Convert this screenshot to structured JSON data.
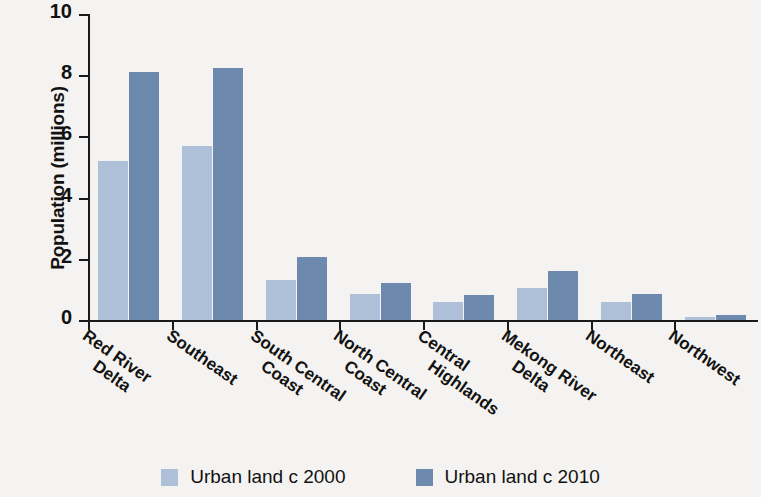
{
  "chart_data": {
    "type": "bar",
    "title": "",
    "xlabel": "",
    "ylabel": "Population (millions)",
    "ylim": [
      0,
      10
    ],
    "yticks": [
      0,
      2,
      4,
      6,
      8,
      10
    ],
    "grid": false,
    "legend_position": "bottom",
    "categories": [
      "Red River Delta",
      "Southeast",
      "South Central Coast",
      "North Central Coast",
      "Central Highlands",
      "Mekong River Delta",
      "Northeast",
      "Northwest"
    ],
    "category_lines": [
      [
        "Red River",
        "Delta"
      ],
      [
        "Southeast"
      ],
      [
        "South Central",
        "Coast"
      ],
      [
        "North Central",
        "Coast"
      ],
      [
        "Central",
        "Highlands"
      ],
      [
        "Mekong River",
        "Delta"
      ],
      [
        "Northeast"
      ],
      [
        "Northwest"
      ]
    ],
    "series": [
      {
        "name": "Urban land c 2000",
        "color": "#aec0d8",
        "values": [
          5.2,
          5.7,
          1.3,
          0.85,
          0.6,
          1.05,
          0.58,
          0.1
        ]
      },
      {
        "name": "Urban land c 2010",
        "color": "#6d89ad",
        "values": [
          8.1,
          8.25,
          2.05,
          1.2,
          0.82,
          1.6,
          0.85,
          0.17
        ]
      }
    ]
  },
  "legend": {
    "items": [
      {
        "label": "Urban land c 2000"
      },
      {
        "label": "Urban land c 2010"
      }
    ]
  }
}
